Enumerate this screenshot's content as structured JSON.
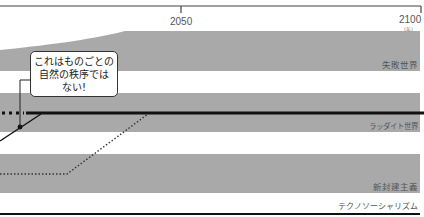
{
  "axis": {
    "ticks": [
      {
        "label": "2050"
      },
      {
        "label": "2100"
      }
    ],
    "unit": "(年)"
  },
  "bands": [
    {
      "label": "失敗世界"
    },
    {
      "label": "ラッダイト世界"
    },
    {
      "label": "新封建主義"
    },
    {
      "label": "テクノソーシャリズム"
    }
  ],
  "callout": {
    "lines": [
      "これはものごとの",
      "自然の秩序では",
      "ない!"
    ]
  },
  "colors": {
    "band_fill": "#a9a9a9",
    "line": "#111111",
    "axis": "#444444"
  }
}
